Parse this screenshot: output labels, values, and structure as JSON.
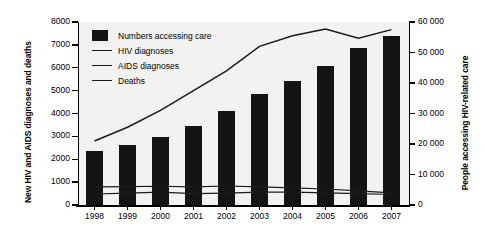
{
  "chart_data": {
    "type": "bar",
    "title": "",
    "xlabel": "",
    "ylabel": "New HIV and AIDS diagnoses and deaths",
    "y2label": "People accessing HIV-related care",
    "categories": [
      "1998",
      "1999",
      "2000",
      "2001",
      "2002",
      "2003",
      "2004",
      "2005",
      "2006",
      "2007"
    ],
    "ylim": [
      0,
      8000
    ],
    "y2lim": [
      0,
      60000
    ],
    "yticks": [
      "0",
      "1000",
      "2000",
      "3000",
      "4000",
      "5000",
      "6000",
      "7000",
      "8000"
    ],
    "y2ticks": [
      "0",
      "10 000",
      "20 000",
      "30 000",
      "40 000",
      "50 000",
      "60 000"
    ],
    "grid": false,
    "legend_position": "top-left",
    "series": [
      {
        "name": "Numbers accessing care",
        "kind": "bar",
        "axis": "left",
        "values": [
          2360,
          2630,
          2990,
          3450,
          4120,
          4840,
          5420,
          6070,
          6860,
          7380
        ]
      },
      {
        "name": "HIV diagnoses",
        "kind": "line",
        "axis": "right",
        "values": [
          21000,
          25500,
          31000,
          37500,
          44000,
          52000,
          55500,
          57700,
          54700,
          57500
        ]
      },
      {
        "name": "AIDS diagnoses",
        "kind": "line",
        "axis": "left",
        "values": [
          790,
          800,
          820,
          790,
          830,
          790,
          750,
          700,
          620,
          530
        ]
      },
      {
        "name": "Deaths",
        "kind": "line",
        "axis": "left",
        "values": [
          480,
          520,
          560,
          500,
          520,
          560,
          560,
          530,
          500,
          460
        ]
      }
    ]
  },
  "legend": {
    "items": [
      {
        "label": "Numbers accessing care",
        "marker": "square",
        "color": "#141414"
      },
      {
        "label": "HIV diagnoses",
        "marker": "line",
        "color": "#1a1a1a"
      },
      {
        "label": "AIDS diagnoses",
        "marker": "line",
        "color": "#1a1a1a"
      },
      {
        "label": "Deaths",
        "marker": "line",
        "color": "#1a1a1a"
      }
    ]
  },
  "colors": {
    "bar": "#141414",
    "line": "#1a1a1a",
    "plot_background": "#f2f2f0",
    "axis": "#000000"
  }
}
